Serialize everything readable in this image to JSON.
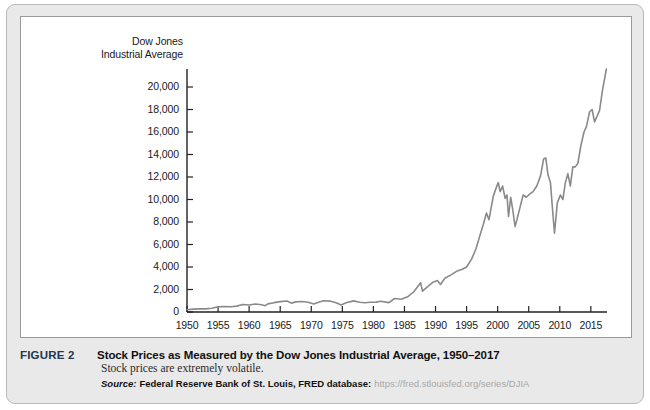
{
  "figure": {
    "label": "FIGURE 2",
    "title": "Stock Prices as Measured by the Dow Jones Industrial Average, 1950–2017",
    "subtitle": "Stock prices are extremely volatile.",
    "source_word": "Source:",
    "source_name": "Federal Reserve Bank of St. Louis, FRED database:",
    "source_url": "https://fred.stlouisfed.org/series/DJIA"
  },
  "colors": {
    "card_background": "#e9e9e9",
    "panel_background": "#ffffff",
    "axis": "#222222",
    "line": "#8a8a8a",
    "figure_label": "#23364b",
    "url": "#a8a8a8"
  },
  "chart_data": {
    "type": "line",
    "title": "Stock Prices as Measured by the Dow Jones Industrial Average, 1950–2017",
    "xlabel": "",
    "ylabel": "Dow Jones Industrial Average",
    "ylabel_lines": [
      "Dow Jones",
      "Industrial Average"
    ],
    "xlim": [
      1950,
      2017.6
    ],
    "ylim": [
      0,
      21600
    ],
    "grid": false,
    "legend": null,
    "yticks": [
      0,
      2000,
      4000,
      6000,
      8000,
      10000,
      12000,
      14000,
      16000,
      18000,
      20000
    ],
    "ytick_labels": [
      "0",
      "2,000",
      "4,000",
      "6,000",
      "8,000",
      "10,000",
      "12,000",
      "14,000",
      "16,000",
      "18,000",
      "20,000"
    ],
    "xticks": [
      1950,
      1955,
      1960,
      1965,
      1970,
      1975,
      1980,
      1985,
      1990,
      1995,
      2000,
      2005,
      2010,
      2015
    ],
    "xtick_labels": [
      "1950",
      "1955",
      "1960",
      "1965",
      "1970",
      "1975",
      "1980",
      "1985",
      "1990",
      "1995",
      "2000",
      "2005",
      "2010",
      "2015"
    ],
    "series": [
      {
        "name": "Dow Jones Industrial Average",
        "x": [
          1950.0,
          1951.0,
          1952.0,
          1953.0,
          1954.0,
          1955.0,
          1956.0,
          1957.0,
          1958.0,
          1959.0,
          1960.0,
          1961.0,
          1962.0,
          1962.6,
          1963.0,
          1964.0,
          1965.0,
          1966.1,
          1966.8,
          1967.5,
          1968.5,
          1969.5,
          1970.4,
          1971.3,
          1972.0,
          1973.0,
          1974.0,
          1974.8,
          1975.6,
          1976.8,
          1977.8,
          1978.6,
          1979.5,
          1980.4,
          1981.2,
          1982.5,
          1983.4,
          1984.5,
          1985.5,
          1986.5,
          1987.6,
          1987.9,
          1988.5,
          1989.6,
          1990.3,
          1990.8,
          1991.5,
          1992.5,
          1993.5,
          1994.3,
          1995.0,
          1995.8,
          1996.5,
          1997.2,
          1997.7,
          1998.2,
          1998.6,
          1998.9,
          1999.3,
          1999.8,
          2000.1,
          2000.4,
          2000.8,
          2001.2,
          2001.5,
          2001.75,
          2002.1,
          2002.4,
          2002.8,
          2003.1,
          2003.6,
          2004.1,
          2004.6,
          2005.2,
          2005.7,
          2006.3,
          2006.9,
          2007.4,
          2007.75,
          2008.1,
          2008.5,
          2008.85,
          2009.15,
          2009.6,
          2010.1,
          2010.5,
          2010.9,
          2011.3,
          2011.7,
          2012.1,
          2012.5,
          2012.9,
          2013.4,
          2013.9,
          2014.3,
          2014.8,
          2015.2,
          2015.6,
          2016.0,
          2016.4,
          2016.9,
          2017.2,
          2017.5
        ],
        "y": [
          200,
          255,
          275,
          280,
          330,
          460,
          490,
          460,
          520,
          660,
          620,
          710,
          640,
          560,
          720,
          830,
          920,
          980,
          790,
          900,
          930,
          870,
          720,
          880,
          1000,
          970,
          820,
          620,
          820,
          990,
          870,
          820,
          860,
          880,
          950,
          830,
          1200,
          1130,
          1350,
          1800,
          2600,
          1850,
          2150,
          2650,
          2800,
          2450,
          3000,
          3300,
          3650,
          3800,
          4000,
          4700,
          5600,
          6900,
          7800,
          8800,
          8200,
          9100,
          10300,
          11100,
          11500,
          10700,
          11200,
          10100,
          10400,
          8500,
          10200,
          9200,
          7600,
          8200,
          9300,
          10400,
          10200,
          10500,
          10700,
          11200,
          12100,
          13600,
          13700,
          12200,
          11500,
          9000,
          7000,
          9700,
          10400,
          10000,
          11500,
          12300,
          11200,
          12900,
          12900,
          13200,
          14800,
          16000,
          16500,
          17800,
          18000,
          16900,
          17400,
          17900,
          19800,
          20700,
          21600
        ]
      }
    ],
    "annotations": []
  }
}
